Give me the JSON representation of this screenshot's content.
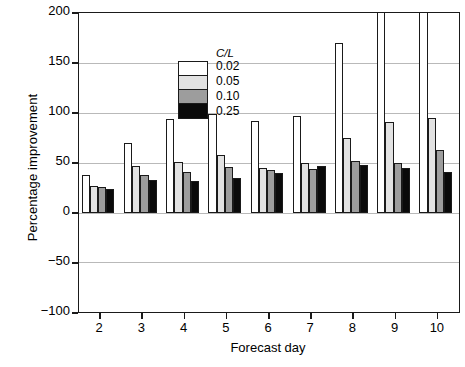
{
  "chart_data": {
    "type": "bar",
    "title": "",
    "xlabel": "Forecast day",
    "ylabel": "Percentage improvement",
    "categories": [
      "2",
      "3",
      "4",
      "5",
      "6",
      "7",
      "8",
      "9",
      "10"
    ],
    "ylim": [
      -100,
      200
    ],
    "yticks": [
      -100,
      -50,
      0,
      50,
      100,
      150,
      200
    ],
    "grid": true,
    "legend_position": "upper-left-inside",
    "legend_title": "C/L",
    "clipped_note": "white bars for days 9 and 10 exceed the 200 axis limit and are clipped at the top frame",
    "series": [
      {
        "name": "0.02",
        "color": "#ffffff",
        "values": [
          38,
          70,
          94,
          99,
          92,
          97,
          170,
          215,
          222
        ]
      },
      {
        "name": "0.05",
        "color": "#e2e2e2",
        "values": [
          27,
          47,
          51,
          58,
          45,
          50,
          75,
          91,
          95
        ]
      },
      {
        "name": "0.10",
        "color": "#9d9d9d",
        "values": [
          26,
          38,
          41,
          46,
          43,
          44,
          52,
          50,
          63
        ]
      },
      {
        "name": "0.25",
        "color": "#0a0a0a",
        "values": [
          24,
          33,
          32,
          35,
          40,
          47,
          48,
          45,
          41
        ]
      }
    ]
  },
  "axis": {
    "y_tick_labels": [
      "200",
      "150",
      "100",
      "50",
      "0",
      "−50",
      "−100"
    ],
    "x_tick_labels": [
      "2",
      "3",
      "4",
      "5",
      "6",
      "7",
      "8",
      "9",
      "10"
    ],
    "y_title": "Percentage improvement",
    "x_title": "Forecast day"
  },
  "legend": {
    "title": "C/L",
    "entries": [
      {
        "label": "0.02",
        "color": "#ffffff"
      },
      {
        "label": "0.05",
        "color": "#e2e2e2"
      },
      {
        "label": "0.10",
        "color": "#9d9d9d"
      },
      {
        "label": "0.25",
        "color": "#0a0a0a"
      }
    ]
  }
}
